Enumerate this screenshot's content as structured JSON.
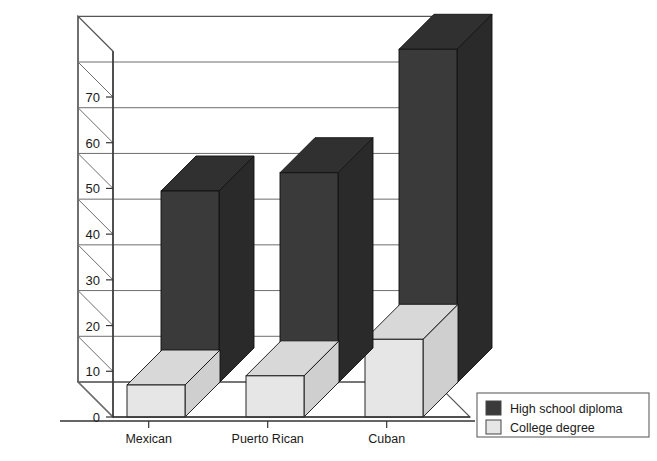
{
  "chart_data": {
    "type": "bar",
    "title": "",
    "subtitle": "",
    "xlabel": "",
    "ylabel": "",
    "categories": [
      "Mexican",
      "Puerto Rican",
      "Cuban"
    ],
    "series": [
      {
        "name": "High school diploma",
        "color": "#3a3a3a",
        "values": [
          42,
          46,
          73
        ]
      },
      {
        "name": "College degree",
        "color": "#e6e6e6",
        "values": [
          7,
          9,
          17
        ]
      }
    ],
    "ylim": [
      0,
      80
    ],
    "yticks": [
      0,
      10,
      20,
      30,
      40,
      50,
      60,
      70
    ],
    "ytick_labels": [
      "0",
      "10",
      "20",
      "30",
      "40",
      "50",
      "60",
      "70"
    ],
    "grid": true,
    "grid_axis": "y",
    "legend_position": "bottom-right",
    "projection": "3d-bar"
  },
  "legend": {
    "entries": [
      {
        "label": "High school diploma",
        "swatch": "#3a3a3a"
      },
      {
        "label": "College degree",
        "swatch": "#e6e6e6"
      }
    ]
  },
  "axis": {
    "y_tick_labels": [
      "0",
      "10",
      "20",
      "30",
      "40",
      "50",
      "60",
      "70"
    ],
    "x_tick_labels": [
      "Mexican",
      "Puerto Rican",
      "Cuban"
    ]
  },
  "colors": {
    "high_school": "#3a3a3a",
    "high_school_top": "#303030",
    "high_school_side": "#2a2a2a",
    "college": "#e6e6e6",
    "college_top": "#d8d8d8",
    "college_side": "#cfcfcf",
    "grid": "#6e6e6e",
    "frame": "#555555",
    "text": "#1a1a1a",
    "background": "#ffffff"
  }
}
